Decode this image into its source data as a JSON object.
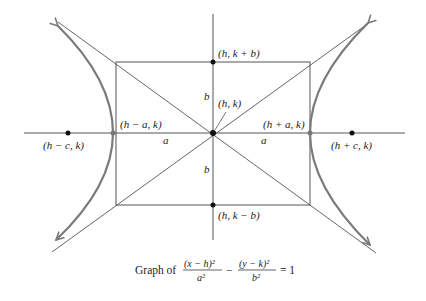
{
  "diagram": {
    "colors": {
      "lines": "#555555",
      "curve": "#7a7a7a",
      "points": "#111111",
      "text": "#222222"
    },
    "labels": {
      "top": "(h, k + b)",
      "bottom": "(h, k − b)",
      "center": "(h, k)",
      "left_vertex": "(h − a, k)",
      "right_vertex": "(h + a, k)",
      "left_focus": "(h − c, k)",
      "right_focus": "(h + c, k)",
      "a_left": "a",
      "a_right": "a",
      "b_top": "b",
      "b_bottom": "b"
    },
    "caption": {
      "prefix": "Graph of",
      "num1": "(x − h)²",
      "den1": "a²",
      "minus": "−",
      "num2": "(y − k)²",
      "den2": "b²",
      "equals": "= 1"
    }
  }
}
